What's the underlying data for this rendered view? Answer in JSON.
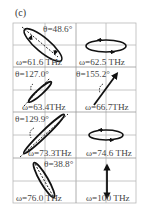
{
  "panel_label": "(c)",
  "grid": {
    "columns": 2,
    "rows": 4,
    "line_color": "#b8b8b8"
  },
  "cells": [
    {
      "row": 0,
      "col": 0,
      "omega_label": "ω=61.6 THz",
      "theta_label": "θ=48.6°",
      "shape": "ellipse",
      "orientation": "tilted, long axis upper-left to lower-right",
      "has_dashed_axis": true
    },
    {
      "row": 0,
      "col": 1,
      "omega_label": "ω=62.5 THz",
      "theta_label": "",
      "shape": "ellipse",
      "orientation": "horizontal",
      "has_dashed_axis": false
    },
    {
      "row": 1,
      "col": 0,
      "omega_label": "ω=63.4THz",
      "theta_label": "θ=127.0°",
      "shape": "narrow ellipse",
      "orientation": "tilted, lower-left to upper-right",
      "has_dashed_axis": true
    },
    {
      "row": 1,
      "col": 1,
      "omega_label": "ω=66.7THz",
      "theta_label": "θ=155.2°",
      "shape": "line",
      "orientation": "lower-left to upper-right",
      "has_dashed_axis": true
    },
    {
      "row": 2,
      "col": 0,
      "omega_label": "ω=73.3THz",
      "theta_label": "θ=129.9°",
      "shape": "narrow ellipse",
      "orientation": "lower-left to upper-right",
      "has_dashed_axis": true
    },
    {
      "row": 2,
      "col": 1,
      "omega_label": "ω=74.6 THz",
      "theta_label": "",
      "shape": "ellipse",
      "orientation": "horizontal",
      "has_dashed_axis": false
    },
    {
      "row": 3,
      "col": 0,
      "omega_label": "ω=76.0 THz",
      "theta_label": "θ=38.8°",
      "shape": "narrow ellipse",
      "orientation": "upper-left to lower-right",
      "has_dashed_axis": true
    },
    {
      "row": 3,
      "col": 1,
      "omega_label": "ω=100 THz",
      "theta_label": "",
      "shape": "double arrow",
      "orientation": "vertical",
      "has_dashed_axis": false
    }
  ]
}
